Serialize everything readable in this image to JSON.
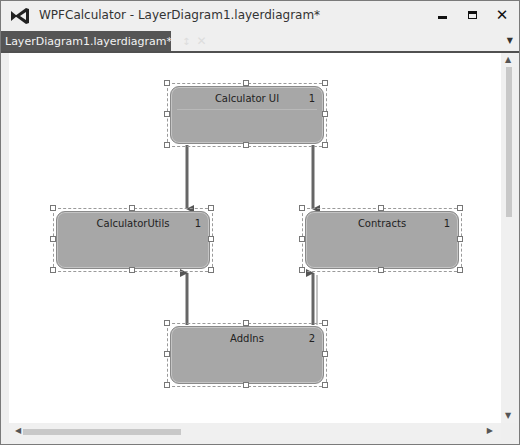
{
  "window": {
    "title": "WPFCalculator - LayerDiagram1.layerdiagram*",
    "icon": "visual-studio-icon",
    "buttons": {
      "minimize": "minimize-icon",
      "maximize": "maximize-icon",
      "close": "close-icon"
    }
  },
  "tabs": [
    {
      "label": "LayerDiagram1.layerdiagram*",
      "pin_icon": "↕",
      "close_icon": "✕",
      "active": true
    }
  ],
  "tab_overflow_icon": "▼",
  "diagram": {
    "layers": [
      {
        "id": "calculator-ui",
        "name": "Calculator UI",
        "count": "1"
      },
      {
        "id": "calculator-utils",
        "name": "CalculatorUtils",
        "count": "1"
      },
      {
        "id": "contracts",
        "name": "Contracts",
        "count": "1"
      },
      {
        "id": "addins",
        "name": "AddIns",
        "count": "2"
      }
    ],
    "dependencies": [
      {
        "from": "Calculator UI",
        "to": "CalculatorUtils"
      },
      {
        "from": "Calculator UI",
        "to": "Contracts"
      },
      {
        "from": "AddIns",
        "to": "CalculatorUtils"
      },
      {
        "from": "AddIns",
        "to": "Contracts"
      }
    ]
  },
  "scrollbars": {
    "up": "▲",
    "down": "▼",
    "left": "◀",
    "right": "▶"
  },
  "colors": {
    "layer_fill": "#a7a7a7",
    "tab_active": "#555555",
    "connector": "#555555"
  }
}
